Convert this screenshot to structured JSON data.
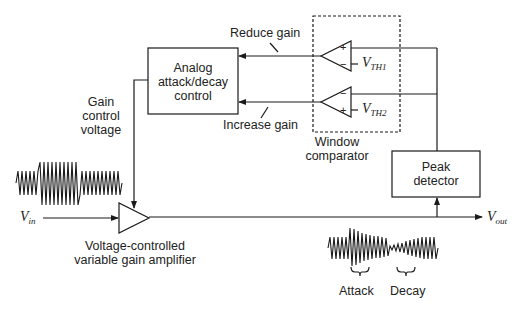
{
  "diagram": {
    "blocks": {
      "attack_decay": {
        "line1": "Analog",
        "line2": "attack/decay",
        "line3": "control"
      },
      "peak_detector": {
        "line1": "Peak",
        "line2": "detector"
      },
      "window_comparator": {
        "line1": "Window",
        "line2": "comparator"
      },
      "amplifier": {
        "line1": "Voltage-controlled",
        "line2": "variable gain amplifier"
      }
    },
    "labels": {
      "reduce_gain": "Reduce gain",
      "increase_gain": "Increase gain",
      "gain_control": {
        "line1": "Gain",
        "line2": "control",
        "line3": "voltage"
      },
      "vin": {
        "main": "V",
        "sub": "in"
      },
      "vout": {
        "main": "V",
        "sub": "out"
      },
      "vth1": {
        "main": "V",
        "sub": "TH1"
      },
      "vth2": {
        "main": "V",
        "sub": "TH2"
      },
      "attack": "Attack",
      "decay": "Decay"
    },
    "comparators": [
      {
        "top_sign": "+",
        "bottom_sign": "−"
      },
      {
        "top_sign": "−",
        "bottom_sign": "+"
      }
    ],
    "colors": {
      "stroke": "#1a1a1a",
      "background": "#ffffff"
    }
  }
}
